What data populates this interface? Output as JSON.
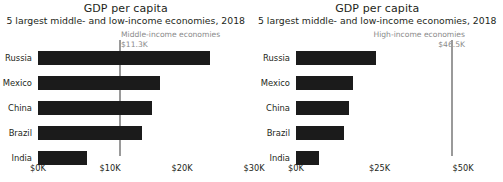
{
  "chart_data": [
    {
      "type": "bar",
      "orientation": "horizontal",
      "panel": "left",
      "title": "GDP per capita",
      "subtitle": "5 largest middle- and low-income economies, 2018",
      "xlabel": "",
      "ylabel": "",
      "categories": [
        "Russia",
        "Mexico",
        "China",
        "Brazil",
        "India"
      ],
      "values": [
        23.9,
        17.0,
        15.8,
        14.5,
        6.8
      ],
      "unit": "thousand USD",
      "xlim": [
        0,
        32
      ],
      "ticks": [
        {
          "label": "$0K",
          "value": 0
        },
        {
          "label": "$10K",
          "value": 10
        },
        {
          "label": "$20K",
          "value": 20
        },
        {
          "label": "$30K",
          "value": 30
        }
      ],
      "grid": false,
      "legend": "none",
      "bar_color": "#1b1b1b",
      "reference_line": {
        "label": "Middle-income economies",
        "value_label": "$11.3K",
        "value": 11.3,
        "color": "#9a9a9a",
        "align": "left"
      }
    },
    {
      "type": "bar",
      "orientation": "horizontal",
      "panel": "right",
      "title": "GDP per capita",
      "subtitle": "5 largest middle- and low-income economies, 2018",
      "xlabel": "",
      "ylabel": "",
      "categories": [
        "Russia",
        "Mexico",
        "China",
        "Brazil",
        "India"
      ],
      "values": [
        23.9,
        17.0,
        15.8,
        14.5,
        6.8
      ],
      "unit": "thousand USD",
      "xlim": [
        0,
        52
      ],
      "ticks": [
        {
          "label": "$0K",
          "value": 0
        },
        {
          "label": "$25K",
          "value": 25
        },
        {
          "label": "$50K",
          "value": 50
        }
      ],
      "grid": false,
      "legend": "none",
      "bar_color": "#1b1b1b",
      "reference_line": {
        "label": "High-income economies",
        "value_label": "$46.5K",
        "value": 46.5,
        "color": "#9a9a9a",
        "align": "right"
      }
    }
  ],
  "left_panel": {
    "title": "GDP per capita",
    "subtitle": "5 largest middle- and low-income economies, 2018",
    "annotation": {
      "label": "Middle-income economies",
      "value": "$11.3K"
    },
    "bars": [
      {
        "label": "Russia"
      },
      {
        "label": "Mexico"
      },
      {
        "label": "China"
      },
      {
        "label": "Brazil"
      },
      {
        "label": "India"
      }
    ],
    "ticks": [
      {
        "label": "$0K"
      },
      {
        "label": "$10K"
      },
      {
        "label": "$20K"
      },
      {
        "label": "$30K"
      }
    ]
  },
  "right_panel": {
    "title": "GDP per capita",
    "subtitle": "5 largest middle- and low-income economies, 2018",
    "annotation": {
      "label": "High-income economies",
      "value": "$46.5K"
    },
    "bars": [
      {
        "label": "Russia"
      },
      {
        "label": "Mexico"
      },
      {
        "label": "China"
      },
      {
        "label": "Brazil"
      },
      {
        "label": "India"
      }
    ],
    "ticks": [
      {
        "label": "$0K"
      },
      {
        "label": "$25K"
      },
      {
        "label": "$50K"
      }
    ]
  }
}
